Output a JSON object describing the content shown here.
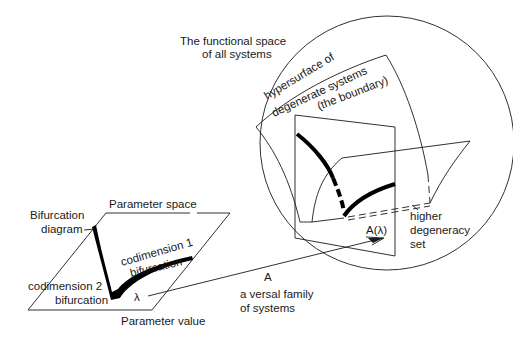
{
  "diagram": {
    "functional_space": {
      "title_line1": "The functional space",
      "title_line2": "of all systems"
    },
    "hypersurface": {
      "line1": "hypersurface of",
      "line2": "degenerate systems",
      "line3": "(the boundary)"
    },
    "higher_degeneracy": {
      "line1": "higher",
      "line2": "degeneracy",
      "line3": "set"
    },
    "image_point": "A(λ)",
    "map_label": "A",
    "versal_family": {
      "line1": "a versal family",
      "line2": "of systems"
    },
    "parameter_space": {
      "title": "Parameter space",
      "value_label": "Parameter value",
      "lambda": "λ",
      "bifurcation_diagram": {
        "line1": "Bifurcation",
        "line2": "diagram"
      },
      "codim1": {
        "line1": "codimension 1",
        "line2": "bifurcation"
      },
      "codim2": {
        "line1": "codimension  2",
        "line2": "bifurcation"
      }
    },
    "colors": {
      "ink": "#1a1a1a",
      "background": "#ffffff"
    }
  }
}
